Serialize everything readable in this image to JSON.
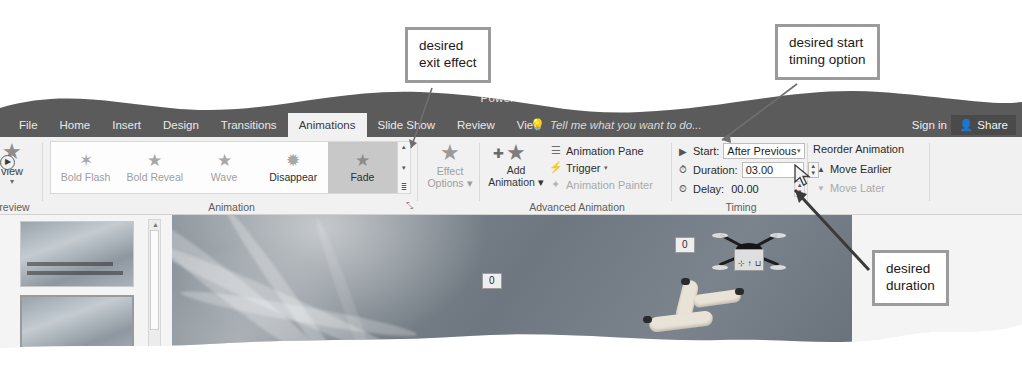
{
  "app": {
    "title": "PowerPoint",
    "quick_access_icons": [
      "save-icon",
      "undo-icon",
      "redo-icon",
      "customize-icon"
    ],
    "window_buttons": [
      "restore-icon",
      "close-icon"
    ]
  },
  "tabs": [
    {
      "label": "File",
      "active": false,
      "clipped": true
    },
    {
      "label": "Home",
      "active": false
    },
    {
      "label": "Insert",
      "active": false
    },
    {
      "label": "Design",
      "active": false
    },
    {
      "label": "Transitions",
      "active": false
    },
    {
      "label": "Animations",
      "active": true
    },
    {
      "label": "Slide Show",
      "active": false
    },
    {
      "label": "Review",
      "active": false
    },
    {
      "label": "View",
      "active": false
    }
  ],
  "tell_me": {
    "placeholder": "Tell me what you want to do...",
    "icon": "lightbulb-icon"
  },
  "account": {
    "sign_in": "Sign in",
    "share": "Share",
    "share_icon": "person-share-icon"
  },
  "ribbon": {
    "groups": [
      {
        "name": "Preview",
        "label": "Preview",
        "button": {
          "label": "view",
          "full_label": "Preview",
          "icon": "preview-play-icon"
        }
      },
      {
        "name": "Animation",
        "label": "Animation",
        "gallery": [
          {
            "label": "Bold Flash",
            "icon": "bold-flash-star-icon",
            "enabled": false,
            "selected": false
          },
          {
            "label": "Bold Reveal",
            "icon": "bold-reveal-star-icon",
            "enabled": false,
            "selected": false
          },
          {
            "label": "Wave",
            "icon": "wave-star-icon",
            "enabled": false,
            "selected": false
          },
          {
            "label": "Disappear",
            "icon": "disappear-star-icon",
            "enabled": true,
            "selected": false
          },
          {
            "label": "Fade",
            "icon": "fade-star-icon",
            "enabled": true,
            "selected": true
          }
        ],
        "scroll": {
          "up": "▴",
          "down": "▾",
          "more": "≣"
        },
        "dialog_launcher": "⤡"
      },
      {
        "name": "EffectOptions",
        "button": {
          "line1": "Effect",
          "line2": "Options",
          "icon": "effect-options-star-icon",
          "enabled": false,
          "dropdown": "▾"
        }
      },
      {
        "name": "AdvancedAnimation",
        "label": "Advanced Animation",
        "add_animation": {
          "line1": "Add",
          "line2": "Animation",
          "icon": "add-animation-star-icon",
          "dropdown": "▾"
        },
        "items": [
          {
            "label": "Animation Pane",
            "icon": "animation-pane-icon",
            "enabled": true,
            "dropdown": ""
          },
          {
            "label": "Trigger",
            "icon": "trigger-bolt-icon",
            "enabled": true,
            "dropdown": "▾"
          },
          {
            "label": "Animation Painter",
            "icon": "animation-painter-icon",
            "enabled": false,
            "dropdown": ""
          }
        ]
      },
      {
        "name": "Timing",
        "label": "Timing",
        "rows": [
          {
            "key": "start",
            "icon": "play-triangle-icon",
            "label": "Start:",
            "value": "After Previous",
            "control": "combo"
          },
          {
            "key": "duration",
            "icon": "clock-icon",
            "label": "Duration:",
            "value": "03.00",
            "control": "spinner"
          },
          {
            "key": "delay",
            "icon": "clock-delay-icon",
            "label": "Delay:",
            "value": "00.00",
            "control": "spinner"
          }
        ]
      },
      {
        "name": "ReorderAnimation",
        "title": "Reorder Animation",
        "items": [
          {
            "label": "Move Earlier",
            "icon": "arrow-up-icon",
            "enabled": true
          },
          {
            "label": "Move Later",
            "icon": "arrow-down-icon",
            "enabled": false
          }
        ]
      }
    ]
  },
  "workspace": {
    "thumbnails": [
      {
        "index": 1,
        "selected": false,
        "name": "slide-thumbnail-1"
      },
      {
        "index": 2,
        "selected": true,
        "name": "slide-thumbnail-2"
      }
    ],
    "scrollbar": {
      "up_arrow": "▲"
    },
    "slide": {
      "animation_badges": [
        {
          "label": "0",
          "x": 310,
          "y": 58
        },
        {
          "label": "0",
          "x": 503,
          "y": 22
        }
      ],
      "objects": [
        "drone-photo",
        "hand-photo"
      ],
      "drone_panel_icons": [
        "wrench-icon",
        "arrow-icon",
        "pillar-icon"
      ]
    }
  },
  "callouts": [
    {
      "id": "desired-exit-effect",
      "text": "desired\nexit effect"
    },
    {
      "id": "desired-start-timing-option",
      "text": "desired start\ntiming option"
    },
    {
      "id": "desired-duration",
      "text": "desired\nduration"
    }
  ],
  "cursor": {
    "type": "arrow-pointer",
    "x": 798,
    "y": 172
  },
  "colors": {
    "titlebar": "#5b5b5b",
    "ribbon_bg": "#f1f1f1",
    "tab_active_bg": "#f1f1f1",
    "selected_gallery_item": "#c8c8c8",
    "callout_border": "#9b9b9b",
    "callout_bg": "#ffffff",
    "slide_bg": "#7b848c"
  }
}
